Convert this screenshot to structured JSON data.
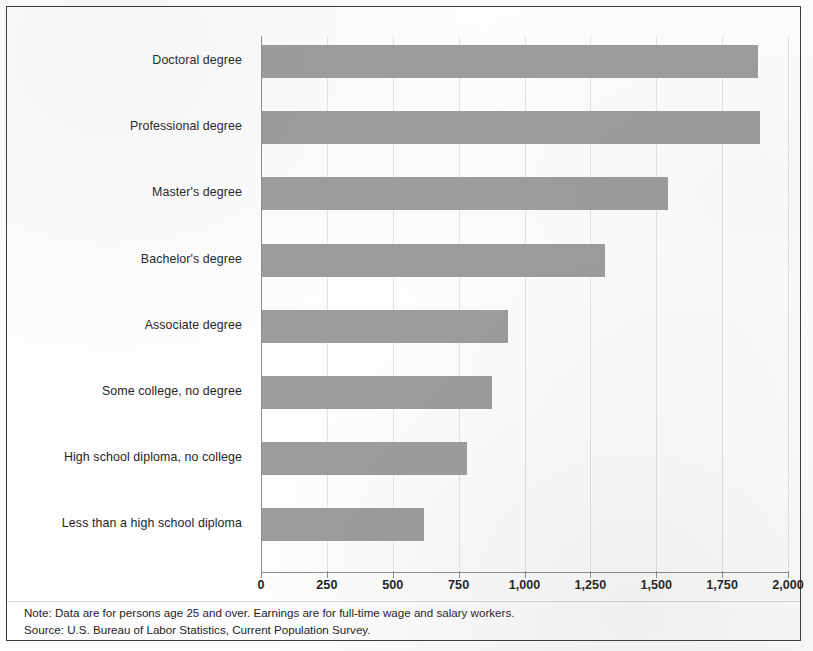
{
  "chart_data": {
    "type": "bar",
    "orientation": "horizontal",
    "title": "",
    "subtitle": "",
    "xlabel": "",
    "ylabel": "",
    "xlim": [
      0,
      2000
    ],
    "xticks": [
      0,
      250,
      500,
      750,
      1000,
      1250,
      1500,
      1750,
      2000
    ],
    "xtick_labels": [
      "0",
      "250",
      "500",
      "750",
      "1,000",
      "1,250",
      "1,500",
      "1,750",
      "2,000"
    ],
    "grid": true,
    "grid_axis": "x",
    "legend": false,
    "bar_color": "#9c9c9c",
    "categories": [
      "Doctoral degree",
      "Professional degree",
      "Master's degree",
      "Bachelor's degree",
      "Associate degree",
      "Some college, no degree",
      "High school diploma, no college",
      "Less than a high school diploma"
    ],
    "values": [
      1885,
      1893,
      1545,
      1305,
      938,
      877,
      781,
      619
    ],
    "series": [
      {
        "name": "Median usual weekly earnings",
        "values": [
          1885,
          1893,
          1545,
          1305,
          938,
          877,
          781,
          619
        ]
      }
    ],
    "annotations": [
      "Note: Data are for persons age 25 and over. Earnings are for full-time wage and salary workers.",
      "Source: U.S. Bureau of Labor Statistics, Current Population Survey."
    ]
  },
  "footnote": {
    "note": "Note: Data are for persons age 25 and over. Earnings are for full-time wage and salary workers.",
    "source": "Source: U.S. Bureau of Labor Statistics, Current Population Survey."
  }
}
